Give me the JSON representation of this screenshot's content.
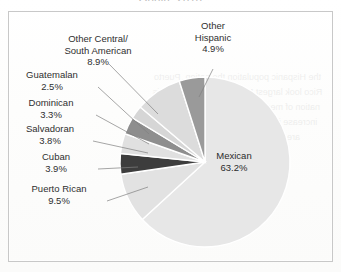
{
  "document": {
    "title_fragment": "Origin, 2010",
    "frame_color": "#c8c8c8",
    "paper_color": "#fdfdfc"
  },
  "bleed_through_text": "the Hispanic population the nation. Puerto Rico look largest Mexican-origin group this nation of medium-size the 2010 count, an increase important for the nation abroad are broadly a series of Mexican",
  "chart_data": {
    "type": "pie",
    "title": "Origin, 2010",
    "xlabel": "",
    "ylabel": "",
    "units": "percent",
    "legend": "none",
    "labels_position": "outside-with-leader-lines",
    "start_angle_deg": 0,
    "direction": "clockwise",
    "categories": [
      "Mexican",
      "Puerto Rican",
      "Cuban",
      "Salvadoran",
      "Dominican",
      "Guatemalan",
      "Other Central/South American",
      "Other Hispanic"
    ],
    "values": [
      63.2,
      9.5,
      3.9,
      3.8,
      3.3,
      2.5,
      8.9,
      4.9
    ],
    "colors": [
      "#e7e7e7",
      "#e2e2e2",
      "#3d3d3d",
      "#e0e0e0",
      "#8e8e8e",
      "#d6d6d6",
      "#dcdcdc",
      "#9a9a9a"
    ],
    "slices": [
      {
        "name": "Mexican",
        "value": 63.2,
        "label": "Mexican",
        "value_text": "63.2%",
        "color": "#e7e7e7",
        "label_placement": "inside"
      },
      {
        "name": "Puerto Rican",
        "value": 9.5,
        "label": "Puerto Rican",
        "value_text": "9.5%",
        "color": "#e2e2e2",
        "label_placement": "outside-left"
      },
      {
        "name": "Cuban",
        "value": 3.9,
        "label": "Cuban",
        "value_text": "3.9%",
        "color": "#3d3d3d",
        "label_placement": "outside-left"
      },
      {
        "name": "Salvadoran",
        "value": 3.8,
        "label": "Salvadoran",
        "value_text": "3.8%",
        "color": "#e0e0e0",
        "label_placement": "outside-left"
      },
      {
        "name": "Dominican",
        "value": 3.3,
        "label": "Dominican",
        "value_text": "3.3%",
        "color": "#8e8e8e",
        "label_placement": "outside-left"
      },
      {
        "name": "Guatemalan",
        "value": 2.5,
        "label": "Guatemalan",
        "value_text": "2.5%",
        "color": "#d6d6d6",
        "label_placement": "outside-left"
      },
      {
        "name": "Other Central/South American",
        "value": 8.9,
        "label_line1": "Other Central/",
        "label_line2": "South American",
        "value_text": "8.9%",
        "color": "#dcdcdc",
        "label_placement": "outside-top-left"
      },
      {
        "name": "Other Hispanic",
        "value": 4.9,
        "label_line1": "Other",
        "label_line2": "Hispanic",
        "value_text": "4.9%",
        "color": "#9a9a9a",
        "label_placement": "outside-top"
      }
    ]
  }
}
